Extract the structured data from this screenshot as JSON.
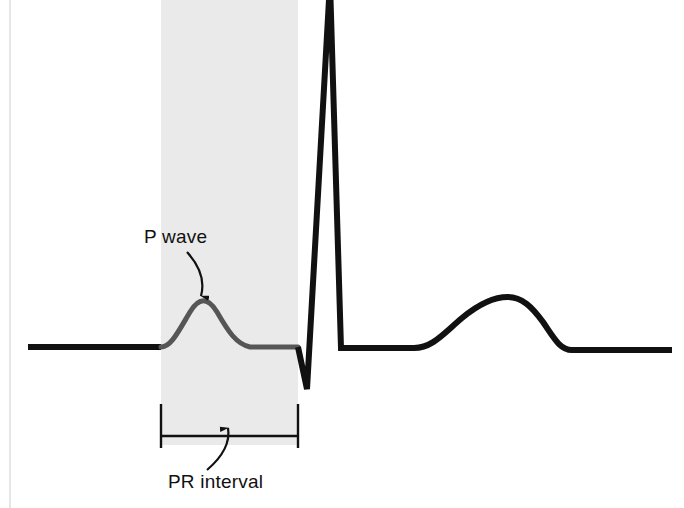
{
  "figure": {
    "kind": "ecg-waveform-diagram",
    "width": 684,
    "height": 508,
    "background_color": "#ffffff",
    "border_color": "#dcdcdc"
  },
  "highlight_band": {
    "name": "pr-interval-shaded-band",
    "color": "#eaeaea",
    "x_start": 161,
    "x_end": 298,
    "y_start": 0,
    "y_end": 445
  },
  "annotations": {
    "p_wave": {
      "label": "P wave",
      "text_x": 144,
      "text_y": 243,
      "arrow_from": [
        187,
        252
      ],
      "arrow_to": [
        201,
        296
      ],
      "color": "#111111"
    },
    "pr_interval": {
      "label": "PR interval",
      "text_x": 168,
      "text_y": 488,
      "arrow_from": [
        207,
        470
      ],
      "arrow_to": [
        228,
        428
      ],
      "color": "#111111"
    }
  },
  "bracket": {
    "name": "pr-interval-bracket",
    "left_x": 161,
    "right_x": 298,
    "line_y": 436,
    "cap_top_y": 404,
    "cap_bottom_y": 448,
    "color": "#111111",
    "stroke_width": 2.4
  },
  "trace": {
    "baseline_y": 347,
    "black_color": "#111111",
    "gray_color": "#565656",
    "black_stroke_width": 6,
    "gray_stroke_width": 5,
    "segments": {
      "baseline_left": "M 28 347 L 161 347",
      "p_wave": "M 161 347 C 171 347 178 332 190 312 C 199 297 208 297 217 312 C 228 331 236 344 250 347 L 298 347",
      "qrs": "M 298 347 L 307 389 L 330 -18 L 341 348 L 414 348",
      "t_wave": "M 414 348 C 432 348 443 334 462 318 C 480 303 494 297 508 297 C 522 297 532 307 543 322 C 554 338 560 350 572 350 L 672 350"
    }
  },
  "waveform_points": {
    "p_wave_peak": [
      203,
      298
    ],
    "q_trough": [
      307,
      389
    ],
    "r_peak": [
      330,
      0
    ],
    "s_junction": [
      341,
      348
    ],
    "t_peak": [
      508,
      297
    ],
    "trace_start_x": 28,
    "trace_end_x": 672
  }
}
